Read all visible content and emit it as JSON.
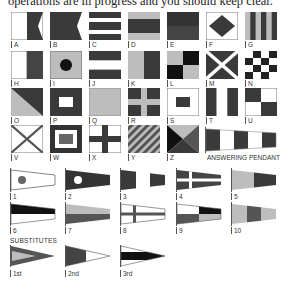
{
  "intro_text": "operations are in progress and you should keep clear.",
  "colors": {
    "dark": "#3a3a3a",
    "mid": "#6e6e6e",
    "light": "#bdbdbd",
    "white": "#ffffff",
    "black": "#111111"
  },
  "alphabet_flags": [
    {
      "letter": "A"
    },
    {
      "letter": "B"
    },
    {
      "letter": "C"
    },
    {
      "letter": "D"
    },
    {
      "letter": "E"
    },
    {
      "letter": "F"
    },
    {
      "letter": "G"
    },
    {
      "letter": "H"
    },
    {
      "letter": "I"
    },
    {
      "letter": "J"
    },
    {
      "letter": "K"
    },
    {
      "letter": "L"
    },
    {
      "letter": "M"
    },
    {
      "letter": "N"
    },
    {
      "letter": "O"
    },
    {
      "letter": "P"
    },
    {
      "letter": "Q"
    },
    {
      "letter": "R"
    },
    {
      "letter": "S"
    },
    {
      "letter": "T"
    },
    {
      "letter": "U"
    },
    {
      "letter": "V"
    },
    {
      "letter": "W"
    },
    {
      "letter": "X"
    },
    {
      "letter": "Y"
    },
    {
      "letter": "Z"
    }
  ],
  "answering_pendant_label": "ANSWERING PENDANT",
  "numeral_pendants": [
    {
      "label": "1"
    },
    {
      "label": "2"
    },
    {
      "label": "3"
    },
    {
      "label": "4"
    },
    {
      "label": "5"
    },
    {
      "label": "6"
    },
    {
      "label": "7"
    },
    {
      "label": "8"
    },
    {
      "label": "9"
    },
    {
      "label": "10"
    }
  ],
  "substitutes_heading": "SUBSTITUTES",
  "substitutes": [
    {
      "label": "1st"
    },
    {
      "label": "2nd"
    },
    {
      "label": "3rd"
    }
  ]
}
